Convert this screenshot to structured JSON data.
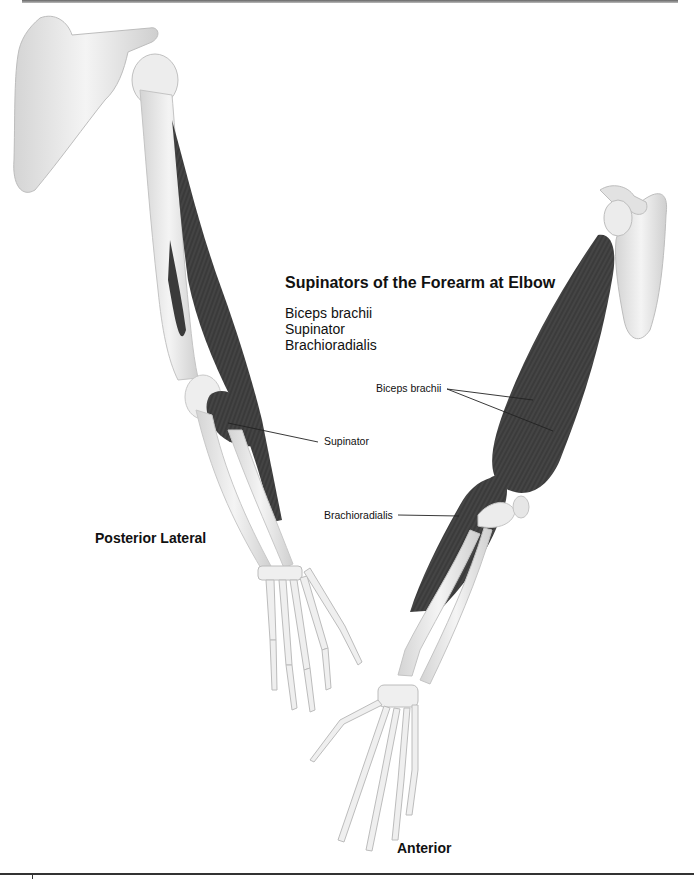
{
  "diagram": {
    "title": "Supinators of the Forearm at Elbow",
    "muscles": [
      "Biceps brachii",
      "Supinator",
      "Brachioradialis"
    ],
    "callouts": {
      "biceps": "Biceps brachii",
      "supinator": "Supinator",
      "brachioradialis": "Brachioradialis"
    },
    "views": {
      "left": "Posterior Lateral",
      "right": "Anterior"
    },
    "colors": {
      "bone": "#ececec",
      "bone_shade": "#c8c8c8",
      "muscle": "#3a3a3a",
      "muscle_dark": "#262626",
      "leader_line": "#222222"
    }
  }
}
